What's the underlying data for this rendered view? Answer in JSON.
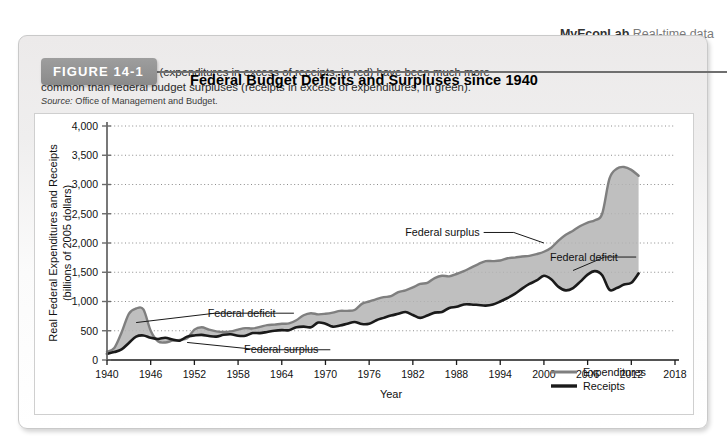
{
  "header": {
    "brand": "MyEconLab",
    "brand_suffix": "Real-time data"
  },
  "ghost": {
    "line1": "Distinguishing between Deficits",
    "line2": "nment budget deficit is the amount by which",
    "line3": "eds. We can compare a deficit with the govern"
  },
  "figure": {
    "badge": "FIGURE 14-1",
    "title": "Federal Budget Deficits and Surpluses since 1940",
    "caption": "Federal budget deficits (expenditures in excess of receipts, in red) have been much more common than federal budget surpluses (receipts in excess of expenditures, in green).",
    "source_label": "Source:",
    "source_text": "Office of Management and Budget."
  },
  "chart_data": {
    "type": "area",
    "title": "Federal Budget Deficits and Surpluses since 1940",
    "xlabel": "Year",
    "ylabel": "Real Federal Expenditures and Receipts (billions of 2005 dollars)",
    "ylabel_line1": "Real Federal Expenditures and Receipts",
    "ylabel_line2": "(billions of 2005 dollars)",
    "xlim": [
      1940,
      2018
    ],
    "ylim": [
      0,
      4000
    ],
    "xticks": [
      1940,
      1946,
      1952,
      1958,
      1964,
      1970,
      1976,
      1982,
      1988,
      1994,
      2000,
      2006,
      2012,
      2018
    ],
    "xticklabels": [
      "1940",
      "1946",
      "1952",
      "1958",
      "1964",
      "1970",
      "1976",
      "1982",
      "1988",
      "1994",
      "2000",
      "2006",
      "2012",
      "2018"
    ],
    "yticks": [
      0,
      500,
      1000,
      1500,
      2000,
      2500,
      3000,
      3500,
      4000
    ],
    "yticklabels": [
      "0",
      "500",
      "1,000",
      "1,500",
      "2,000",
      "2,500",
      "3,000",
      "3,500",
      "4,000"
    ],
    "grid": "horizontal-dotted",
    "legend_position": "bottom-right",
    "x": [
      1940,
      1941,
      1942,
      1943,
      1944,
      1945,
      1946,
      1947,
      1948,
      1949,
      1950,
      1951,
      1952,
      1953,
      1954,
      1955,
      1956,
      1957,
      1958,
      1959,
      1960,
      1961,
      1962,
      1963,
      1964,
      1965,
      1966,
      1967,
      1968,
      1969,
      1970,
      1971,
      1972,
      1973,
      1974,
      1975,
      1976,
      1977,
      1978,
      1979,
      1980,
      1981,
      1982,
      1983,
      1984,
      1985,
      1986,
      1987,
      1988,
      1989,
      1990,
      1991,
      1992,
      1993,
      1994,
      1995,
      1996,
      1997,
      1998,
      1999,
      2000,
      2001,
      2002,
      2003,
      2004,
      2005,
      2006,
      2007,
      2008,
      2009,
      2010,
      2011,
      2012,
      2013
    ],
    "series": [
      {
        "name": "Expenditures",
        "color": "#7f7f7f",
        "values": [
          140,
          205,
          470,
          790,
          880,
          865,
          500,
          320,
          300,
          330,
          345,
          370,
          520,
          560,
          520,
          490,
          480,
          490,
          520,
          545,
          540,
          565,
          595,
          605,
          620,
          625,
          680,
          765,
          800,
          780,
          790,
          810,
          840,
          840,
          855,
          960,
          1000,
          1040,
          1075,
          1090,
          1160,
          1190,
          1240,
          1300,
          1320,
          1400,
          1440,
          1430,
          1470,
          1520,
          1580,
          1640,
          1690,
          1690,
          1700,
          1740,
          1750,
          1770,
          1780,
          1810,
          1850,
          1920,
          2040,
          2140,
          2210,
          2290,
          2350,
          2390,
          2500,
          3100,
          3270,
          3300,
          3250,
          3150
        ]
      },
      {
        "name": "Receipts",
        "color": "#1a1a1a",
        "values": [
          105,
          135,
          180,
          290,
          400,
          420,
          380,
          360,
          380,
          350,
          330,
          400,
          420,
          430,
          410,
          400,
          430,
          440,
          415,
          415,
          460,
          460,
          480,
          500,
          510,
          510,
          560,
          570,
          560,
          640,
          620,
          570,
          590,
          620,
          650,
          615,
          620,
          680,
          720,
          760,
          790,
          820,
          770,
          720,
          760,
          810,
          820,
          890,
          910,
          950,
          950,
          940,
          930,
          950,
          1000,
          1060,
          1130,
          1220,
          1300,
          1360,
          1440,
          1380,
          1250,
          1190,
          1230,
          1340,
          1460,
          1520,
          1450,
          1200,
          1230,
          1290,
          1320,
          1480
        ]
      }
    ],
    "annotations": [
      {
        "text": "Federal deficit",
        "x": 1953,
        "y": 800,
        "target_x": 1944,
        "target_y": 640
      },
      {
        "text": "Federal surplus",
        "x": 1958,
        "y": 175,
        "target_x": 1951,
        "target_y": 300
      },
      {
        "text": "Federal surplus",
        "x": 1992,
        "y": 2180,
        "target_x": 2000,
        "target_y": 2000
      },
      {
        "text": "Federal deficit",
        "x": 2000,
        "y": 1760,
        "target_x": 2004,
        "target_y": 1530
      }
    ],
    "legend": [
      {
        "label": "Expenditures",
        "color": "#7f7f7f"
      },
      {
        "label": "Receipts",
        "color": "#1a1a1a"
      }
    ]
  }
}
